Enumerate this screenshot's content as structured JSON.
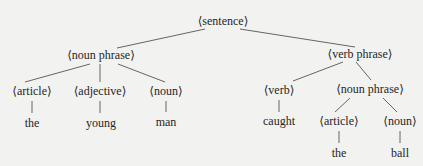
{
  "diagram": {
    "type": "parse-tree",
    "colors": {
      "background": "#f2f2f0",
      "text": "#262626",
      "edge": "#555555"
    },
    "nodes": {
      "sentence": {
        "label": "⟨sentence⟩",
        "x": 223,
        "y": 21
      },
      "np1": {
        "label": "⟨noun phrase⟩",
        "x": 101,
        "y": 55
      },
      "vp": {
        "label": "⟨verb phrase⟩",
        "x": 360,
        "y": 54
      },
      "article1": {
        "label": "⟨article⟩",
        "x": 32,
        "y": 91
      },
      "adjective": {
        "label": "⟨adjective⟩",
        "x": 100,
        "y": 91
      },
      "noun1": {
        "label": "⟨noun⟩",
        "x": 166,
        "y": 91
      },
      "verb": {
        "label": "⟨verb⟩",
        "x": 279,
        "y": 90
      },
      "np2": {
        "label": "⟨noun phrase⟩",
        "x": 370,
        "y": 89
      },
      "article2": {
        "label": "⟨article⟩",
        "x": 339,
        "y": 121
      },
      "noun2": {
        "label": "⟨noun⟩",
        "x": 400,
        "y": 121
      },
      "leaf_the1": {
        "label": "the",
        "x": 32,
        "y": 123
      },
      "leaf_young": {
        "label": "young",
        "x": 101,
        "y": 123
      },
      "leaf_man": {
        "label": "man",
        "x": 166,
        "y": 122
      },
      "leaf_caught": {
        "label": "caught",
        "x": 279,
        "y": 121
      },
      "leaf_the2": {
        "label": "the",
        "x": 339,
        "y": 153
      },
      "leaf_ball": {
        "label": "ball",
        "x": 400,
        "y": 153
      }
    },
    "edges": [
      {
        "from": "sentence",
        "to": "np1",
        "x1": 205,
        "y1": 29,
        "x2": 117,
        "y2": 48
      },
      {
        "from": "sentence",
        "to": "vp",
        "x1": 240,
        "y1": 29,
        "x2": 355,
        "y2": 47
      },
      {
        "from": "np1",
        "to": "article1",
        "x1": 90,
        "y1": 64,
        "x2": 25,
        "y2": 82
      },
      {
        "from": "np1",
        "to": "adjective",
        "x1": 100,
        "y1": 64,
        "x2": 100,
        "y2": 82
      },
      {
        "from": "np1",
        "to": "noun1",
        "x1": 118,
        "y1": 64,
        "x2": 165,
        "y2": 82
      },
      {
        "from": "vp",
        "to": "verb",
        "x1": 343,
        "y1": 62,
        "x2": 293,
        "y2": 81
      },
      {
        "from": "vp",
        "to": "np2",
        "x1": 356,
        "y1": 62,
        "x2": 371,
        "y2": 80
      },
      {
        "from": "article1",
        "to": "leaf_the1",
        "x1": 32,
        "y1": 101,
        "x2": 32,
        "y2": 113
      },
      {
        "from": "adjective",
        "to": "leaf_young",
        "x1": 100,
        "y1": 101,
        "x2": 100,
        "y2": 113
      },
      {
        "from": "noun1",
        "to": "leaf_man",
        "x1": 166,
        "y1": 101,
        "x2": 166,
        "y2": 112
      },
      {
        "from": "verb",
        "to": "leaf_caught",
        "x1": 279,
        "y1": 100,
        "x2": 279,
        "y2": 112
      },
      {
        "from": "np2",
        "to": "article2",
        "x1": 350,
        "y1": 98,
        "x2": 335,
        "y2": 112
      },
      {
        "from": "np2",
        "to": "noun2",
        "x1": 383,
        "y1": 98,
        "x2": 397,
        "y2": 112
      },
      {
        "from": "article2",
        "to": "leaf_the2",
        "x1": 339,
        "y1": 131,
        "x2": 339,
        "y2": 143
      },
      {
        "from": "noun2",
        "to": "leaf_ball",
        "x1": 400,
        "y1": 131,
        "x2": 400,
        "y2": 143
      }
    ]
  }
}
